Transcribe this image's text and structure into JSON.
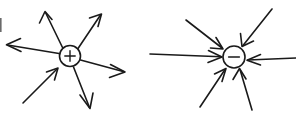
{
  "figure": {
    "background_color": "#ffffff",
    "stroke_color": "#1a1a1a",
    "width": 296,
    "height": 116,
    "style": "hand-drawn line art, no text labels"
  },
  "diagrams": [
    {
      "id": "positive-charge-diagram",
      "name": "Positive point charge with radiating field lines",
      "charge_sign": "+",
      "charge_label": "+",
      "center": {
        "x": 70,
        "y": 56
      },
      "radius": 10.5,
      "arrow_count": 6,
      "outward_count": 5,
      "inward_count": 1,
      "arrows": [
        {
          "name": "upper-left-outward",
          "direction": "outward",
          "tail": {
            "x": 62,
            "y": 47
          },
          "tip": {
            "x": 45,
            "y": 12
          }
        },
        {
          "name": "upper-right-outward",
          "direction": "outward",
          "tail": {
            "x": 78,
            "y": 48
          },
          "tip": {
            "x": 101,
            "y": 15
          }
        },
        {
          "name": "left-outward",
          "direction": "outward",
          "tail": {
            "x": 59,
            "y": 53
          },
          "tip": {
            "x": 7,
            "y": 45
          }
        },
        {
          "name": "right-outward",
          "direction": "outward",
          "tail": {
            "x": 81,
            "y": 60
          },
          "tip": {
            "x": 124,
            "y": 72
          }
        },
        {
          "name": "lower-right-outward",
          "direction": "outward",
          "tail": {
            "x": 74,
            "y": 67
          },
          "tip": {
            "x": 90,
            "y": 108
          }
        },
        {
          "name": "lower-left-inward",
          "direction": "inward",
          "tail": {
            "x": 23,
            "y": 103
          },
          "tip": {
            "x": 57,
            "y": 69
          }
        }
      ]
    },
    {
      "id": "negative-charge-diagram",
      "name": "Negative point charge with converging field lines",
      "charge_sign": "-",
      "charge_label": "–",
      "center": {
        "x": 234,
        "y": 57
      },
      "radius": 11,
      "arrow_count": 6,
      "outward_count": 0,
      "inward_count": 6,
      "arrows": [
        {
          "name": "upper-left-inward",
          "direction": "inward",
          "tail": {
            "x": 186,
            "y": 20
          },
          "tip": {
            "x": 222,
            "y": 48
          }
        },
        {
          "name": "upper-right-inward",
          "direction": "inward",
          "tail": {
            "x": 272,
            "y": 9
          },
          "tip": {
            "x": 243,
            "y": 45
          }
        },
        {
          "name": "left-inward",
          "direction": "inward",
          "tail": {
            "x": 150,
            "y": 54
          },
          "tip": {
            "x": 221,
            "y": 57
          }
        },
        {
          "name": "right-inward",
          "direction": "inward",
          "tail": {
            "x": 296,
            "y": 58
          },
          "tip": {
            "x": 248,
            "y": 60
          }
        },
        {
          "name": "lower-left-inward",
          "direction": "inward",
          "tail": {
            "x": 200,
            "y": 107
          },
          "tip": {
            "x": 225,
            "y": 70
          }
        },
        {
          "name": "lower-right-inward",
          "direction": "inward",
          "tail": {
            "x": 252,
            "y": 110
          },
          "tip": {
            "x": 240,
            "y": 70
          }
        }
      ]
    }
  ],
  "artifacts": {
    "left_edge_fleck": {
      "x": 0,
      "y": 18,
      "width": 2,
      "height": 14
    }
  }
}
